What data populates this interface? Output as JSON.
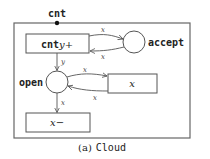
{
  "diagram": {
    "type": "petri-net",
    "caption_prefix": "(a)",
    "caption_name": "Cloud",
    "interface_port": {
      "label": "cnt"
    },
    "places": [
      {
        "id": "accept",
        "label": "accept"
      },
      {
        "id": "open",
        "label": "open"
      }
    ],
    "transitions": [
      {
        "id": "cnt-y-plus",
        "label_mono": "cnt",
        "label_var": "y",
        "label_op": "+"
      },
      {
        "id": "x",
        "label_var": "x"
      },
      {
        "id": "x-minus",
        "label_var": "x",
        "label_op": "−"
      }
    ],
    "arcs": [
      {
        "from": "cnt-y-plus",
        "to": "accept",
        "label": "x"
      },
      {
        "from": "accept",
        "to": "cnt-y-plus",
        "label": "x"
      },
      {
        "from": "cnt-y-plus",
        "to": "open",
        "label": "y"
      },
      {
        "from": "open",
        "to": "x",
        "label": "x"
      },
      {
        "from": "x",
        "to": "open",
        "label": "x"
      },
      {
        "from": "open",
        "to": "x-minus",
        "label": "x"
      }
    ]
  },
  "colors": {
    "stroke": "#555555",
    "text": "#222222",
    "background": "#ffffff"
  }
}
